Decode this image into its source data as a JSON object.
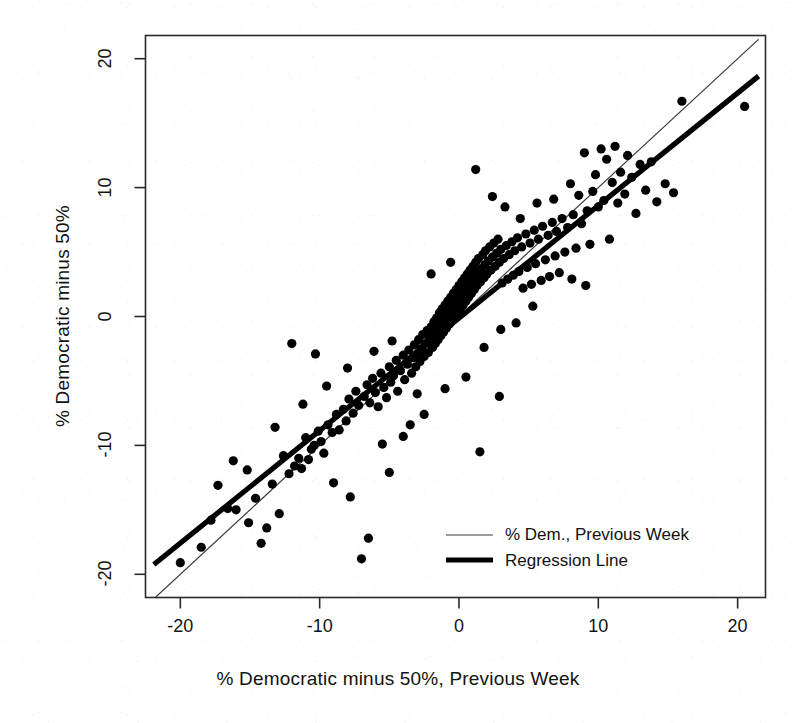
{
  "chart_data": {
    "type": "scatter",
    "title": "",
    "xlabel": "% Democratic minus 50%, Previous Week",
    "ylabel": "% Democratic minus 50%",
    "xlim": [
      -22.5,
      22.0
    ],
    "ylim": [
      -21.8,
      21.8
    ],
    "xticks": [
      -20,
      -10,
      0,
      10,
      20
    ],
    "yticks": [
      -20,
      -10,
      0,
      10,
      20
    ],
    "xtick_labels": [
      "-20",
      "-10",
      "0",
      "10",
      "20"
    ],
    "ytick_labels": [
      "-20",
      "-10",
      "0",
      "10",
      "20"
    ],
    "grid": false,
    "box": true,
    "point_color": "#000000",
    "point_size": 4.6,
    "legend": {
      "position": "bottom-right inside plot",
      "entries": [
        {
          "label": "% Dem., Previous Week",
          "style": "thin-line",
          "color": "#3a3a3a",
          "width": 1.2
        },
        {
          "label": "Regression Line",
          "style": "thick-line",
          "color": "#000000",
          "width": 5.0
        }
      ]
    },
    "lines": [
      {
        "name": "% Dem., Previous Week",
        "description": "identity line y = x",
        "slope": 1.0,
        "intercept": 0.0,
        "x_from": -21.9,
        "x_to": 21.5,
        "color": "#3a3a3a",
        "width": 1.2
      },
      {
        "name": "Regression Line",
        "description": "least-squares fit of current week on previous week",
        "slope": 0.873,
        "intercept": -0.12,
        "x_from": -21.9,
        "x_to": 21.5,
        "color": "#000000",
        "width": 5.2
      }
    ],
    "series": [
      {
        "name": "Poll weeks",
        "marker": "filled-circle",
        "points": [
          [
            -17.3,
            -13.1
          ],
          [
            -16.6,
            -14.9
          ],
          [
            -16.0,
            -15.0
          ],
          [
            -15.1,
            -16.0
          ],
          [
            -14.6,
            -14.1
          ],
          [
            -14.2,
            -17.6
          ],
          [
            -13.4,
            -13.0
          ],
          [
            -12.9,
            -15.3
          ],
          [
            -12.6,
            -10.8
          ],
          [
            -12.2,
            -12.2
          ],
          [
            -11.8,
            -11.6
          ],
          [
            -11.5,
            -11.0
          ],
          [
            -11.3,
            -11.8
          ],
          [
            -11.0,
            -9.4
          ],
          [
            -10.8,
            -11.1
          ],
          [
            -10.6,
            -10.3
          ],
          [
            -10.4,
            -10.0
          ],
          [
            -10.1,
            -8.9
          ],
          [
            -9.9,
            -9.7
          ],
          [
            -9.7,
            -10.6
          ],
          [
            -9.4,
            -8.4
          ],
          [
            -9.1,
            -9.0
          ],
          [
            -8.8,
            -7.6
          ],
          [
            -8.6,
            -8.8
          ],
          [
            -8.3,
            -7.2
          ],
          [
            -8.1,
            -8.1
          ],
          [
            -7.9,
            -6.4
          ],
          [
            -7.6,
            -7.5
          ],
          [
            -7.4,
            -5.8
          ],
          [
            -7.2,
            -6.9
          ],
          [
            -7.0,
            -18.8
          ],
          [
            -6.8,
            -6.2
          ],
          [
            -6.6,
            -5.3
          ],
          [
            -6.4,
            -6.7
          ],
          [
            -6.2,
            -4.8
          ],
          [
            -6.0,
            -5.9
          ],
          [
            -5.8,
            -7.0
          ],
          [
            -5.6,
            -4.4
          ],
          [
            -5.4,
            -5.5
          ],
          [
            -5.2,
            -6.3
          ],
          [
            -5.0,
            -3.9
          ],
          [
            -4.9,
            -5.1
          ],
          [
            -4.7,
            -4.6
          ],
          [
            -4.5,
            -3.4
          ],
          [
            -4.4,
            -5.8
          ],
          [
            -4.2,
            -4.2
          ],
          [
            -4.0,
            -3.0
          ],
          [
            -3.9,
            -4.9
          ],
          [
            -3.7,
            -3.7
          ],
          [
            -3.6,
            -2.6
          ],
          [
            -3.4,
            -4.4
          ],
          [
            -3.3,
            -3.2
          ],
          [
            -3.2,
            -2.2
          ],
          [
            -3.1,
            -3.9
          ],
          [
            -3.0,
            -2.9
          ],
          [
            -2.9,
            -1.8
          ],
          [
            -2.8,
            -3.5
          ],
          [
            -2.7,
            -2.5
          ],
          [
            -2.6,
            -1.4
          ],
          [
            -2.5,
            -3.1
          ],
          [
            -2.4,
            -2.1
          ],
          [
            -2.3,
            -1.1
          ],
          [
            -2.2,
            -2.8
          ],
          [
            -2.1,
            -1.7
          ],
          [
            -2.0,
            -0.8
          ],
          [
            -1.9,
            -2.4
          ],
          [
            -1.85,
            -1.4
          ],
          [
            -1.8,
            -0.4
          ],
          [
            -1.7,
            -2.1
          ],
          [
            -1.65,
            -1.1
          ],
          [
            -1.6,
            -0.1
          ],
          [
            -1.5,
            -1.8
          ],
          [
            -1.45,
            -0.8
          ],
          [
            -1.4,
            0.3
          ],
          [
            -1.3,
            -1.5
          ],
          [
            -1.25,
            -0.5
          ],
          [
            -1.2,
            0.6
          ],
          [
            -1.1,
            -1.2
          ],
          [
            -1.05,
            -0.2
          ],
          [
            -1.0,
            0.9
          ],
          [
            -0.9,
            -0.9
          ],
          [
            -0.85,
            0.1
          ],
          [
            -0.8,
            1.2
          ],
          [
            -0.7,
            -0.6
          ],
          [
            -0.65,
            0.4
          ],
          [
            -0.6,
            1.5
          ],
          [
            -0.5,
            -0.3
          ],
          [
            -0.45,
            0.7
          ],
          [
            -0.4,
            1.8
          ],
          [
            -0.3,
            0.0
          ],
          [
            -0.25,
            1.0
          ],
          [
            -0.2,
            2.1
          ],
          [
            -0.1,
            0.3
          ],
          [
            -0.05,
            1.3
          ],
          [
            0.0,
            2.4
          ],
          [
            0.1,
            0.6
          ],
          [
            0.15,
            1.6
          ],
          [
            0.2,
            2.7
          ],
          [
            0.3,
            0.9
          ],
          [
            0.35,
            1.9
          ],
          [
            0.4,
            3.0
          ],
          [
            0.5,
            1.2
          ],
          [
            0.55,
            2.2
          ],
          [
            0.6,
            3.3
          ],
          [
            0.7,
            1.5
          ],
          [
            0.75,
            2.5
          ],
          [
            0.8,
            3.6
          ],
          [
            0.9,
            1.8
          ],
          [
            0.95,
            2.8
          ],
          [
            1.0,
            3.9
          ],
          [
            1.1,
            2.1
          ],
          [
            1.15,
            3.1
          ],
          [
            1.2,
            4.2
          ],
          [
            1.3,
            2.4
          ],
          [
            1.35,
            3.4
          ],
          [
            1.4,
            4.5
          ],
          [
            1.5,
            -10.5
          ],
          [
            1.55,
            2.7
          ],
          [
            1.6,
            3.7
          ],
          [
            1.7,
            4.8
          ],
          [
            1.8,
            3.0
          ],
          [
            1.85,
            4.0
          ],
          [
            1.9,
            5.1
          ],
          [
            2.0,
            3.3
          ],
          [
            2.1,
            4.3
          ],
          [
            2.2,
            5.4
          ],
          [
            2.3,
            3.6
          ],
          [
            2.4,
            4.6
          ],
          [
            2.5,
            5.7
          ],
          [
            2.6,
            3.9
          ],
          [
            2.7,
            4.9
          ],
          [
            2.8,
            6.0
          ],
          [
            2.9,
            4.2
          ],
          [
            3.0,
            5.2
          ],
          [
            3.1,
            2.6
          ],
          [
            3.2,
            4.5
          ],
          [
            3.4,
            5.5
          ],
          [
            3.5,
            2.9
          ],
          [
            3.6,
            4.8
          ],
          [
            3.8,
            5.8
          ],
          [
            3.9,
            3.2
          ],
          [
            4.0,
            5.1
          ],
          [
            4.2,
            6.1
          ],
          [
            4.3,
            3.5
          ],
          [
            4.5,
            5.4
          ],
          [
            4.6,
            2.2
          ],
          [
            4.8,
            6.4
          ],
          [
            4.9,
            3.8
          ],
          [
            5.1,
            5.7
          ],
          [
            5.2,
            2.5
          ],
          [
            5.4,
            6.7
          ],
          [
            5.5,
            4.1
          ],
          [
            5.7,
            6.0
          ],
          [
            5.9,
            2.8
          ],
          [
            6.0,
            7.0
          ],
          [
            6.2,
            4.4
          ],
          [
            6.4,
            6.3
          ],
          [
            6.5,
            3.1
          ],
          [
            6.7,
            7.3
          ],
          [
            6.9,
            4.7
          ],
          [
            7.0,
            6.6
          ],
          [
            7.2,
            3.4
          ],
          [
            7.4,
            7.6
          ],
          [
            7.6,
            5.0
          ],
          [
            7.8,
            6.9
          ],
          [
            8.0,
            10.3
          ],
          [
            8.2,
            7.9
          ],
          [
            8.4,
            5.3
          ],
          [
            8.6,
            9.4
          ],
          [
            8.8,
            7.2
          ],
          [
            9.0,
            12.7
          ],
          [
            9.2,
            8.2
          ],
          [
            9.4,
            5.6
          ],
          [
            9.6,
            9.7
          ],
          [
            9.8,
            11.0
          ],
          [
            10.0,
            8.5
          ],
          [
            10.2,
            13.0
          ],
          [
            10.4,
            9.0
          ],
          [
            10.6,
            12.2
          ],
          [
            10.8,
            6.0
          ],
          [
            11.0,
            10.4
          ],
          [
            11.2,
            13.2
          ],
          [
            11.4,
            8.8
          ],
          [
            11.6,
            11.2
          ],
          [
            11.9,
            9.5
          ],
          [
            12.1,
            12.5
          ],
          [
            12.4,
            10.8
          ],
          [
            12.7,
            8.0
          ],
          [
            13.0,
            11.8
          ],
          [
            13.4,
            9.8
          ],
          [
            13.8,
            12.0
          ],
          [
            14.2,
            8.9
          ],
          [
            14.8,
            10.3
          ],
          [
            15.4,
            9.6
          ],
          [
            16.0,
            16.7
          ],
          [
            20.5,
            16.3
          ],
          [
            -20.0,
            -19.1
          ],
          [
            -18.5,
            -17.9
          ],
          [
            -17.8,
            -15.8
          ],
          [
            -13.8,
            -16.4
          ],
          [
            -12.0,
            -2.1
          ],
          [
            -10.3,
            -2.9
          ],
          [
            -9.0,
            -12.9
          ],
          [
            -7.8,
            -14.0
          ],
          [
            -6.5,
            -17.2
          ],
          [
            -5.0,
            -12.1
          ],
          [
            -4.0,
            -9.3
          ],
          [
            -3.5,
            -8.4
          ],
          [
            -2.5,
            -7.6
          ],
          [
            -1.0,
            -5.6
          ],
          [
            0.5,
            -4.7
          ],
          [
            1.2,
            11.4
          ],
          [
            2.4,
            9.3
          ],
          [
            3.3,
            8.5
          ],
          [
            4.4,
            7.6
          ],
          [
            5.6,
            8.8
          ],
          [
            6.8,
            9.1
          ],
          [
            8.1,
            2.9
          ],
          [
            9.1,
            2.4
          ],
          [
            2.9,
            -6.2
          ],
          [
            4.1,
            -0.5
          ],
          [
            5.3,
            0.8
          ],
          [
            -8.0,
            -4.0
          ],
          [
            -6.1,
            -2.7
          ],
          [
            -4.8,
            -1.9
          ],
          [
            -2.0,
            3.3
          ],
          [
            -0.6,
            4.2
          ],
          [
            1.8,
            -2.4
          ],
          [
            3.0,
            -1.0
          ],
          [
            -11.2,
            -6.8
          ],
          [
            -9.5,
            -5.4
          ],
          [
            -13.2,
            -8.6
          ],
          [
            -15.2,
            -11.9
          ],
          [
            -16.2,
            -11.2
          ],
          [
            -5.5,
            -9.9
          ],
          [
            -3.0,
            -6.0
          ]
        ]
      }
    ]
  }
}
